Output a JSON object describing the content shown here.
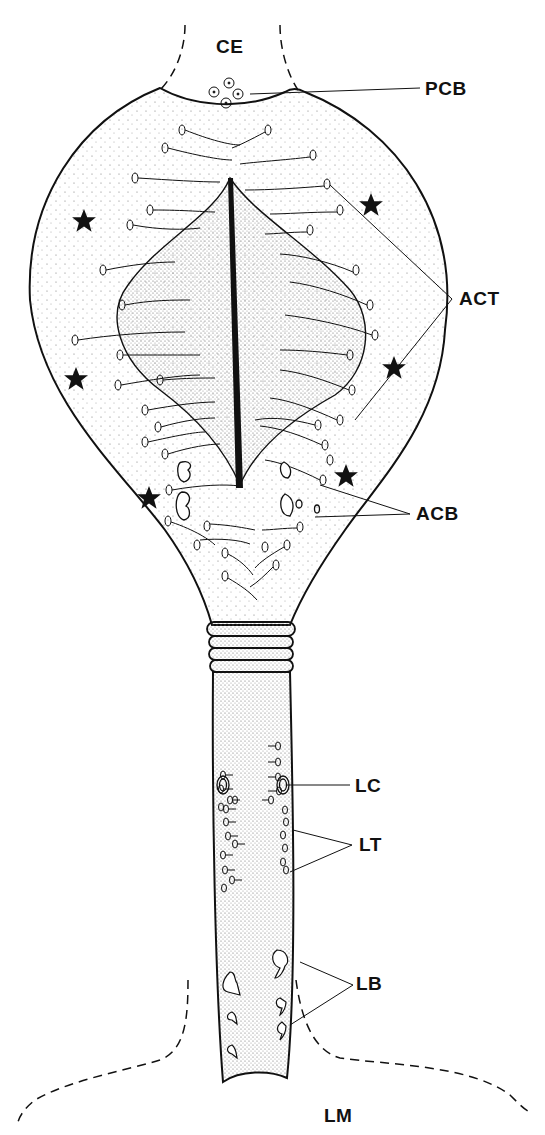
{
  "diagram": {
    "type": "biological-line-drawing",
    "colors": {
      "ink": "#111111",
      "stipple": "#555555",
      "background": "#ffffff"
    },
    "labels": {
      "ce": "CE",
      "pcb": "PCB",
      "act": "ACT",
      "acb": "ACB",
      "lc": "LC",
      "lt": "LT",
      "lb": "LB",
      "lm": "LM"
    },
    "star_markers": 6
  }
}
